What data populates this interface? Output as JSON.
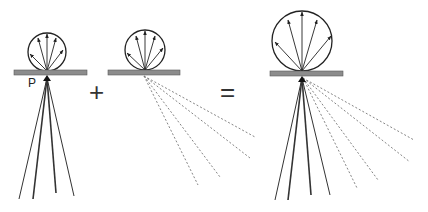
{
  "diagram": {
    "title": "",
    "point_label": "P",
    "operators": {
      "plus": "+",
      "equals": "="
    },
    "colors": {
      "surface": "#8c8c8c",
      "surface_border": "#5a5a5a",
      "stroke": "#333333",
      "dashed": "#777777"
    },
    "panels": [
      {
        "id": "left",
        "description": "Diffuse reflection lobe plus solid transmitted rays from point P"
      },
      {
        "id": "middle",
        "description": "Diffuse reflection lobe plus dashed scattered rays"
      },
      {
        "id": "right",
        "description": "Combined larger lobe plus solid and dashed rays"
      }
    ]
  }
}
